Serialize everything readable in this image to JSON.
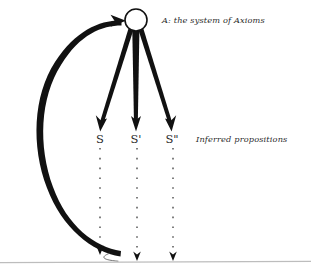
{
  "diagram": {
    "title_label": "A: the system of Axioms",
    "inferred_label": "Inferred propositions",
    "background_color": "#ffffff",
    "ink_color": "#111111",
    "baseline_color": "#bdbdbd",
    "axiom_node": {
      "name": "A",
      "shape": "circle",
      "fill": "#ffffff",
      "stroke": "#111111",
      "cx": 136,
      "cy": 20,
      "r": 11
    },
    "propositions": [
      {
        "label": "S",
        "x": 100,
        "y": 139
      },
      {
        "label": "S'",
        "x": 136,
        "y": 139
      },
      {
        "label": "S\"",
        "x": 172,
        "y": 139
      }
    ],
    "deduction_arrows": [
      {
        "from": "A",
        "to": "S",
        "style": "solid-wedge"
      },
      {
        "from": "A",
        "to": "S'",
        "style": "solid-wedge"
      },
      {
        "from": "A",
        "to": "S\"",
        "style": "solid-wedge"
      }
    ],
    "dotted_drops": [
      {
        "from": "S",
        "x": 100,
        "y_top": 148,
        "y_bottom": 252
      },
      {
        "from": "S'",
        "x": 137,
        "y_top": 148,
        "y_bottom": 258
      },
      {
        "from": "S\"",
        "x": 173,
        "y_top": 148,
        "y_bottom": 258
      }
    ],
    "feedback_arc": {
      "description": "thick curved arrow from experience baseline up to the axiom node",
      "direction": "upward",
      "target": "A"
    },
    "baseline": {
      "name": "experience-baseline",
      "y": 262,
      "x_start": 0,
      "x_end": 311
    }
  }
}
